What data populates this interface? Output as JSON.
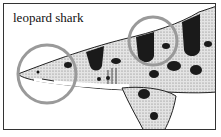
{
  "figure": {
    "label": "leopard shark",
    "circle_color": "#9a9a9a",
    "body_color": "#d8d8d8",
    "spot_color": "#1a1a1a",
    "highlights": [
      "snout",
      "dorsal-saddle"
    ]
  }
}
